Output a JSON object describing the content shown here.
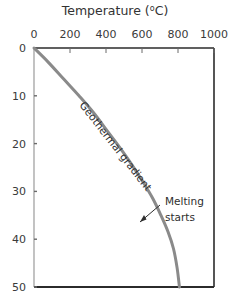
{
  "chart_data": {
    "type": "line",
    "xlabel": "Temperature (°C)",
    "ylabel": "",
    "x_axis_position": "top",
    "y_axis_inverted": true,
    "grid": false,
    "legend": "none",
    "xlim": [
      0,
      1000
    ],
    "ylim": [
      0,
      50
    ],
    "x_ticks": [
      0,
      200,
      400,
      600,
      800,
      1000
    ],
    "x_tick_labels": [
      "0",
      "200",
      "400",
      "600",
      "800",
      "1000"
    ],
    "y_ticks": [
      0,
      10,
      20,
      30,
      40,
      50
    ],
    "y_tick_labels": [
      "0",
      "10",
      "20",
      "30",
      "40",
      "50"
    ],
    "series": [
      {
        "name": "Geothermal gradient",
        "color": "#8a8a8a",
        "x": [
          0,
          80,
          165,
          250,
          330,
          410,
          480,
          545,
          605,
          660,
          705,
          745,
          775,
          795,
          808
        ],
        "y": [
          0,
          3,
          6.5,
          10,
          13.5,
          17.5,
          21,
          24.5,
          28,
          31.5,
          35,
          38.5,
          42,
          46,
          50
        ]
      }
    ],
    "annotations": [
      {
        "name": "Geothermal gradient",
        "text": "Geothermal gradient",
        "x": 250,
        "y": 12,
        "rotation": 52
      },
      {
        "name": "Melting starts",
        "text_line_1": "Melting",
        "text_line_2": "starts",
        "x": 700,
        "y": 33,
        "arrow_to_x": 600,
        "arrow_to_y": 37
      }
    ]
  },
  "chart": {
    "title_main": "Temperature (",
    "title_degree": "o",
    "title_unit": "C)"
  },
  "colors": {
    "curve": "#8a8a8a",
    "axis": "#2b2b2b",
    "text": "#3a3a3a",
    "background": "#ffffff"
  }
}
